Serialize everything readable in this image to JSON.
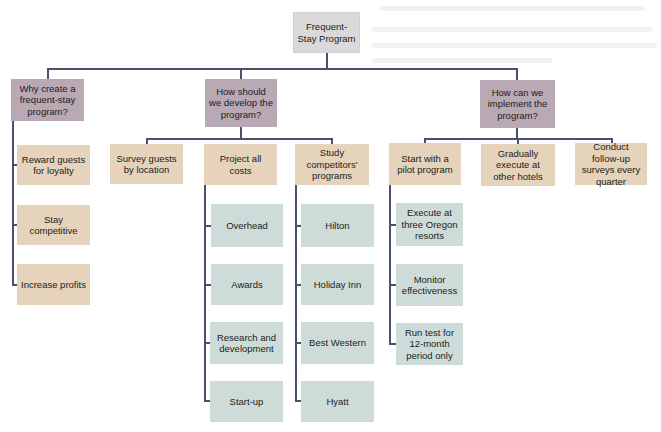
{
  "diagram": {
    "type": "tree",
    "colors": {
      "root": "#d9d9d9",
      "question": "#b9a9b5",
      "action": "#e5d3bb",
      "detail": "#cedcd9",
      "connector": "#4a5070"
    },
    "root": {
      "label": "Frequent-Stay Program"
    },
    "branches": [
      {
        "label": "Why create a frequent-stay program?",
        "children": [
          {
            "label": "Reward guests for loyalty"
          },
          {
            "label": "Stay competitive"
          },
          {
            "label": "Increase profits"
          }
        ]
      },
      {
        "label": "How should we develop the program?",
        "children": [
          {
            "label": "Survey guests by location"
          },
          {
            "label": "Project all costs",
            "children": [
              {
                "label": "Overhead"
              },
              {
                "label": "Awards"
              },
              {
                "label": "Research and development"
              },
              {
                "label": "Start-up"
              }
            ]
          },
          {
            "label": "Study competitors' programs",
            "children": [
              {
                "label": "Hilton"
              },
              {
                "label": "Holiday Inn"
              },
              {
                "label": "Best Western"
              },
              {
                "label": "Hyatt"
              }
            ]
          }
        ]
      },
      {
        "label": "How can we implement the program?",
        "children": [
          {
            "label": "Start with a pilot program",
            "children": [
              {
                "label": "Execute at three Oregon resorts"
              },
              {
                "label": "Monitor effectiveness"
              },
              {
                "label": "Run test for 12-month period only"
              }
            ]
          },
          {
            "label": "Gradually execute at other hotels"
          },
          {
            "label": "Conduct follow-up surveys every quarter"
          }
        ]
      }
    ]
  }
}
